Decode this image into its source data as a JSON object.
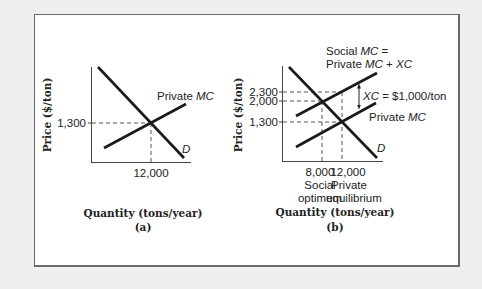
{
  "figure": {
    "panel_a": {
      "caption": "(a)",
      "xlabel": "Quantity (tons/year)",
      "ylabel": "Price ($/ton)",
      "y_tick": "1,300",
      "x_tick": "12,000",
      "curve_private_mc": "Private MC",
      "curve_demand": "D"
    },
    "panel_b": {
      "caption": "(b)",
      "xlabel": "Quantity (tons/year)",
      "ylabel": "Price ($/ton)",
      "y_ticks": [
        "2,300",
        "2,000",
        "1,300"
      ],
      "x_ticks": [
        "8,000",
        "12,000"
      ],
      "x_tick_notes": [
        [
          "Social",
          "optimum"
        ],
        [
          "Private",
          "equilibrium"
        ]
      ],
      "curve_social_mc_line1": "Social MC =",
      "curve_social_mc_line2": "Private MC + XC",
      "xc_label": "XC = $1,000/ton",
      "curve_private_mc": "Private MC",
      "curve_demand": "D"
    }
  },
  "chart_data": [
    {
      "type": "line",
      "title": "(a)",
      "xlabel": "Quantity (tons/year)",
      "ylabel": "Price ($/ton)",
      "series": [
        {
          "name": "Private MC",
          "slope": "upward"
        },
        {
          "name": "D",
          "slope": "downward"
        }
      ],
      "annotations": [
        {
          "label": "Private equilibrium",
          "x": 12000,
          "y": 1300
        }
      ],
      "x_ticks": [
        12000
      ],
      "y_ticks": [
        1300
      ]
    },
    {
      "type": "line",
      "title": "(b)",
      "xlabel": "Quantity (tons/year)",
      "ylabel": "Price ($/ton)",
      "series": [
        {
          "name": "Social MC = Private MC + XC",
          "slope": "upward"
        },
        {
          "name": "Private MC",
          "slope": "upward"
        },
        {
          "name": "D",
          "slope": "downward"
        }
      ],
      "annotations": [
        {
          "label": "Social optimum",
          "x": 8000,
          "y": 2000
        },
        {
          "label": "Private equilibrium",
          "x": 12000,
          "y": 1300
        },
        {
          "label": "XC = $1,000/ton",
          "x": 12000,
          "y_from": 1300,
          "y_to": 2300
        }
      ],
      "x_ticks": [
        8000,
        12000
      ],
      "y_ticks": [
        1300,
        2000,
        2300
      ]
    }
  ]
}
